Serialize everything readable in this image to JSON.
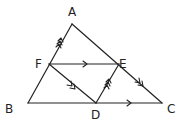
{
  "figure": {
    "points": {
      "A": {
        "label": "A",
        "x": 72,
        "y": 24
      },
      "B": {
        "label": "B",
        "x": 28,
        "y": 103
      },
      "C": {
        "label": "C",
        "x": 162,
        "y": 103
      },
      "D": {
        "label": "D",
        "x": 96,
        "y": 103
      },
      "E": {
        "label": "E",
        "x": 119,
        "y": 64
      },
      "F": {
        "label": "F",
        "x": 49,
        "y": 64
      }
    },
    "segments": [
      "AB",
      "BC",
      "CA",
      "FE",
      "FD",
      "DE"
    ],
    "parallel_marks": [
      {
        "group": "single",
        "segments": [
          "FE",
          "BC"
        ]
      },
      {
        "group": "double",
        "segments": [
          "FD",
          "AC"
        ]
      },
      {
        "group": "triple",
        "segments": [
          "FA",
          "DE"
        ]
      }
    ],
    "stroke_color": "#222222",
    "background": "#ffffff"
  }
}
